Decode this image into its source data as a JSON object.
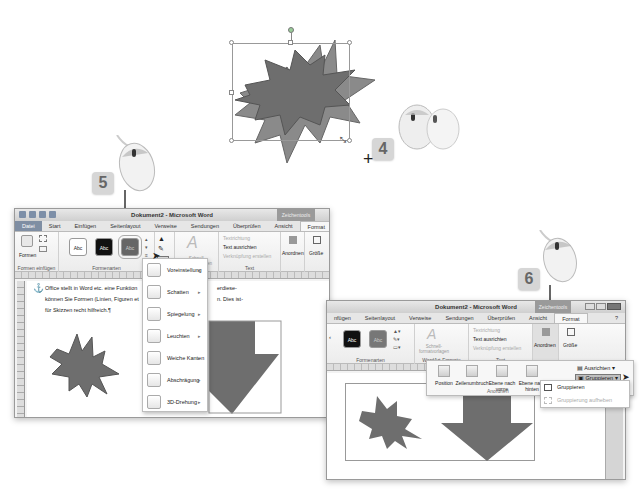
{
  "steps": {
    "step4": "4",
    "step5": "5",
    "step6": "6"
  },
  "window1": {
    "title": "Dokument2 - Microsoft Word",
    "context_tab_header": "Zeichentools",
    "tabs": [
      "Datei",
      "Start",
      "Einfügen",
      "Seitenlayout",
      "Verweise",
      "Sendungen",
      "Überprüfen",
      "Ansicht",
      "Format"
    ],
    "active_tab": "Format",
    "ribbon": {
      "formen_label": "Formen",
      "group_formen_einfuegen": "Formen einfügen",
      "group_formenarten": "Formenarten",
      "style_swatches": [
        "Abc",
        "Abc",
        "Abc"
      ],
      "schnellformat_label": "Schnell-formatvorlagen",
      "textrichtung": "Textrichtung",
      "text_ausrichten": "Text ausrichten",
      "verknuepfung": "Verknüpfung erstellen",
      "group_text": "Text",
      "anordnen": "Anordnen",
      "groesse": "Größe"
    },
    "document_text": [
      "Office stellt in Word etc. eine Funktion",
      "können Sie Formen (Linien, Figuren et",
      "für Skizzen recht hilfreich.¶"
    ],
    "document_text_right": [
      "erdiese-",
      "n. Dies ist-"
    ],
    "effects_menu": [
      {
        "label": "Voreinstellung"
      },
      {
        "label": "Schatten"
      },
      {
        "label": "Spiegelung"
      },
      {
        "label": "Leuchten"
      },
      {
        "label": "Weiche Kanten"
      },
      {
        "label": "Abschrägung"
      },
      {
        "label": "3D-Drehung"
      }
    ]
  },
  "window2": {
    "title": "Dokument2 - Microsoft Word",
    "context_tab_header": "Zeichentools",
    "tabs": [
      "nfügen",
      "Seitenlayout",
      "Verweise",
      "Sendungen",
      "Überprüfen",
      "Ansicht",
      "Format"
    ],
    "active_tab": "Format",
    "ribbon": {
      "group_formenarten": "Formenarten",
      "style_swatches": [
        "Abc",
        "Abc"
      ],
      "schnellformat_label": "Schnell-formatvorlagen",
      "group_wordart": "WordArt-Formate",
      "textrichtung": "Textrichtung",
      "text_ausrichten": "Text ausrichten",
      "verknuepfung": "Verknüpfung erstellen",
      "group_text": "Text",
      "anordnen": "Anordnen",
      "groesse": "Größe"
    },
    "arrange_panel": {
      "buttons": [
        "Position",
        "Zeilenumbruch",
        "Ebene nach vorne",
        "Ebene nach hinten",
        "Auswahlbereich"
      ],
      "group_label": "Anordnen",
      "ausrichten": "Ausrichten",
      "gruppieren": "Gruppieren"
    },
    "group_submenu": [
      {
        "label": "Gruppieren",
        "enabled": true
      },
      {
        "label": "Gruppierung aufheben",
        "enabled": false
      }
    ]
  },
  "colors": {
    "shape_fill": "#6e6e6e",
    "shape_fill_light": "#8a8a8a",
    "selection_handle": "#888888",
    "file_tab": "#7f8ea3"
  }
}
